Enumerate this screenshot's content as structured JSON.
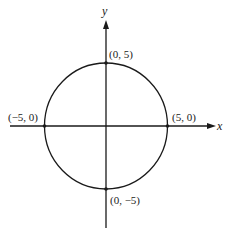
{
  "diagram": {
    "type": "circle-on-cartesian-axes",
    "equation_implied": "x^2 + y^2 = 25",
    "axes": {
      "x_label": "x",
      "y_label": "y"
    },
    "circle": {
      "center": [
        0,
        0
      ],
      "radius": 5
    },
    "points": [
      {
        "name": "top",
        "coords": [
          0,
          5
        ],
        "label": "(0, 5)"
      },
      {
        "name": "left",
        "coords": [
          -5,
          0
        ],
        "label": "(−5, 0)"
      },
      {
        "name": "right",
        "coords": [
          5,
          0
        ],
        "label": "(5, 0)"
      },
      {
        "name": "bottom",
        "coords": [
          0,
          -5
        ],
        "label": "(0, −5)"
      }
    ],
    "colors": {
      "background": "#ffffff",
      "ink": "#1a1a1a"
    }
  }
}
